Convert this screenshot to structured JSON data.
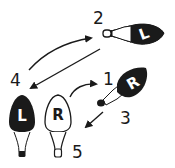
{
  "diagram": {
    "title": "",
    "colors": {
      "ink": "#1a1a1a",
      "paper": "#ffffff"
    },
    "steps": [
      {
        "number": "1",
        "bulb_letter": "R",
        "bulb_fill": "black",
        "orientation": "tilted"
      },
      {
        "number": "2",
        "bulb_letter": "L",
        "bulb_fill": "black",
        "orientation": "sideways"
      },
      {
        "number": "3",
        "bulb_letter": "",
        "bulb_fill": "",
        "orientation": ""
      },
      {
        "number": "4",
        "bulb_letter": "L",
        "bulb_fill": "black",
        "orientation": "upright"
      },
      {
        "number": "5",
        "bulb_letter": "R",
        "bulb_fill": "white",
        "orientation": "upright"
      }
    ],
    "arrows": [
      {
        "from": "4",
        "to": "2",
        "shape": "curved"
      },
      {
        "from": "2",
        "to": "4",
        "shape": "straight"
      },
      {
        "from": "5",
        "to": "1",
        "shape": "curved"
      },
      {
        "from": "1",
        "to": "5",
        "shape": "straight"
      }
    ]
  }
}
